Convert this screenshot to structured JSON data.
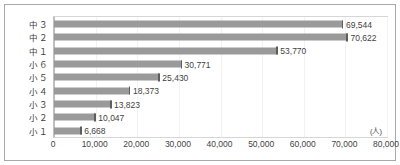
{
  "chart_data": {
    "type": "bar",
    "orientation": "horizontal",
    "title": "",
    "subtitle": "",
    "xlabel": "",
    "ylabel": "",
    "unit_label": "(人)",
    "categories": [
      "中３",
      "中２",
      "中１",
      "小６",
      "小５",
      "小４",
      "小３",
      "小２",
      "小１"
    ],
    "values": [
      69544,
      70622,
      53770,
      30771,
      25430,
      18373,
      13823,
      10047,
      6668
    ],
    "data_labels": [
      "69,544",
      "70,622",
      "53,770",
      "30,771",
      "25,430",
      "18,373",
      "13,823",
      "10,047",
      "6,668"
    ],
    "xlim": [
      0,
      80000
    ],
    "xticks": [
      0,
      10000,
      20000,
      30000,
      40000,
      50000,
      60000,
      70000,
      80000
    ],
    "xtick_labels": [
      "0",
      "10,000",
      "20,000",
      "30,000",
      "40,000",
      "50,000",
      "60,000",
      "70,000",
      "80,000"
    ],
    "grid": true,
    "grid_axis": "x",
    "legend": false,
    "legend_position": "none",
    "bar_color": "#9a9a9a",
    "bar_edge_color": "#5d5d5d",
    "gridline_color": "#f2f2f2",
    "axis_color": "#bfbfbf",
    "text_color": "#3f3f3f",
    "background_color": "#ffffff"
  }
}
